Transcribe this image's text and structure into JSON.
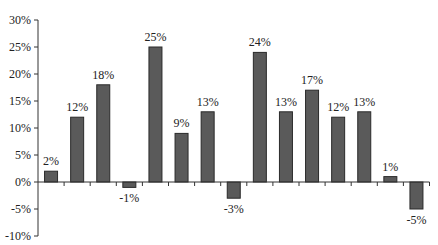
{
  "chart_data": {
    "type": "bar",
    "title": "",
    "xlabel": "",
    "ylabel": "",
    "categories": [
      "1",
      "2",
      "3",
      "4",
      "5",
      "6",
      "7",
      "8",
      "9",
      "10",
      "11",
      "12",
      "13",
      "14",
      "15"
    ],
    "values": [
      2,
      12,
      18,
      -1,
      25,
      9,
      13,
      -3,
      24,
      13,
      17,
      12,
      13,
      1,
      -5
    ],
    "labels": [
      "2%",
      "12%",
      "18%",
      "-1%",
      "25%",
      "9%",
      "13%",
      "-3%",
      "24%",
      "13%",
      "17%",
      "12%",
      "13%",
      "1%",
      "-5%"
    ],
    "ylim": [
      -10,
      30
    ],
    "yticks": [
      30,
      25,
      20,
      15,
      10,
      5,
      0,
      -5,
      -10
    ],
    "ytick_labels": [
      "30%",
      "25%",
      "20%",
      "15%",
      "10%",
      "5%",
      "0%",
      "-5%",
      "-10%"
    ],
    "grid": false,
    "legend": null,
    "colors": {
      "bar_fill": "#5a5a5a",
      "bar_stroke": "#2a2a2a",
      "axis": "#333333"
    }
  }
}
